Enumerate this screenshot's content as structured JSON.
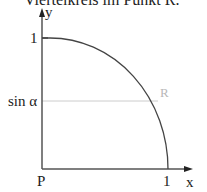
{
  "caption": "Viertelkreis im Punkt R.",
  "diagram": {
    "axes": {
      "x_label": "x",
      "y_label": "y",
      "origin_label": "P"
    },
    "ticks": {
      "x_one": "1",
      "y_one": "1"
    },
    "sin_label": "sin α",
    "point_label": "R",
    "colors": {
      "axis": "#555555",
      "arc": "#444444",
      "guide": "#cccccc",
      "point_label": "#b8b8b8"
    }
  }
}
